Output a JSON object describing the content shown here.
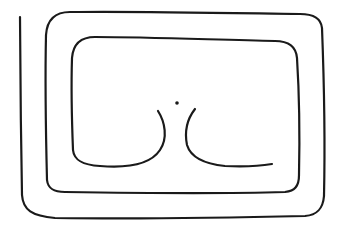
{
  "drawing": {
    "description": "Hand-drawn spiral line ending in two curved cusps around a central dot",
    "stroke_color": "#1a1a1a",
    "background_color": "#ffffff",
    "stroke_width": 2.2,
    "paths": {
      "spiral": "M20,17 C20,60 21,140 22,195 C23,210 32,216 55,218 C120,219 220,218 305,216 C318,215 323,208 324,196 C325,150 324,80 322,28 C321,18 312,14 300,14 C230,13 130,11 70,12 C55,12 47,20 46,35 C45,80 46,140 47,180 C48,189 54,192 65,192 C130,193 220,194 285,192 C295,191 299,186 299,175 C300,130 299,90 297,58 C296,46 288,41 275,41 C220,40 150,37 95,37 C80,37 73,45 72,58 C71,90 72,125 73,150 C74,160 82,165 100,166 C125,168 150,165 160,150 C168,138 165,122 158,111",
      "right_curve": "M195,109 C188,118 184,130 187,145 C191,158 205,164 225,166 C245,167 260,166 272,164"
    },
    "dot": {
      "cx": 177,
      "cy": 103,
      "r": 1.8
    }
  }
}
